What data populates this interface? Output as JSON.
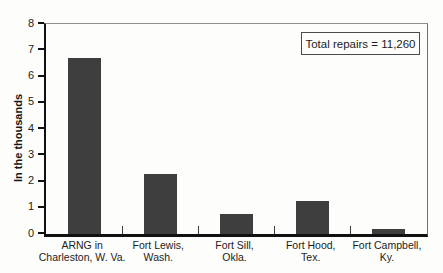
{
  "chart_data": {
    "type": "bar",
    "categories": [
      "ARNG in\nCharleston, W. Va.",
      "Fort Lewis,\nWash.",
      "Fort Sill,\nOkla.",
      "Fort Hood,\nTex.",
      "Fort Campbell,\nKy."
    ],
    "values": [
      6.7,
      2.3,
      0.75,
      1.25,
      0.2
    ],
    "title": "",
    "xlabel": "",
    "ylabel": "In the thousands",
    "ylim": [
      0,
      8
    ],
    "yticks": [
      0,
      1,
      2,
      3,
      4,
      5,
      6,
      7,
      8
    ],
    "grid": false,
    "legend_position": "top-right",
    "annotation": "Total repairs = 11,260",
    "bar_color": "#3e3e3e"
  },
  "legend": {
    "label": "Total repairs = 11,260"
  },
  "axes": {
    "y_title": "In the thousands"
  }
}
